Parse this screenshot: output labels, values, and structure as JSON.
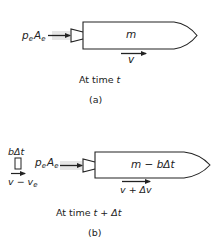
{
  "figure": {
    "colors": {
      "stroke": "#222222",
      "exhaust": "#bdbdbd",
      "background": "#ffffff"
    },
    "panel_a": {
      "pressure_label": {
        "base1": "p",
        "sub1": "e",
        "base2": "A",
        "sub2": "e"
      },
      "mass_label": "m",
      "velocity_label": "v",
      "time_caption": {
        "prefix": "At time ",
        "var": "t"
      },
      "panel_label": "(a)"
    },
    "panel_b": {
      "ejected_mass_label": "bΔt",
      "ejected_velocity_label": {
        "base": "v − v",
        "sub": "e"
      },
      "pressure_label": {
        "base1": "p",
        "sub1": "e",
        "base2": "A",
        "sub2": "e"
      },
      "mass_label": "m − bΔt",
      "velocity_label": "v + Δv",
      "time_caption": {
        "prefix": "At time ",
        "var": "t + Δt"
      },
      "panel_label": "(b)"
    }
  }
}
